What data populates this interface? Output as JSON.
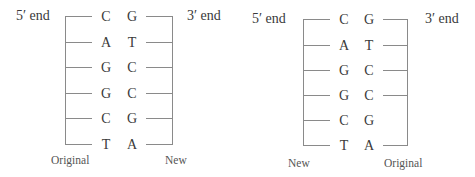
{
  "diagrams": [
    {
      "five_prime_label": "5′ end",
      "three_prime_label": "3′ end",
      "left_strand_label": "Original",
      "right_strand_label": "New",
      "pairs": [
        {
          "left": "C",
          "right": "G",
          "right_tick": true
        },
        {
          "left": "A",
          "right": "T",
          "right_tick": true
        },
        {
          "left": "G",
          "right": "C",
          "right_tick": true
        },
        {
          "left": "G",
          "right": "C",
          "right_tick": true
        },
        {
          "left": "C",
          "right": "G",
          "right_tick": true
        },
        {
          "left": "T",
          "right": "A",
          "right_tick": true
        }
      ]
    },
    {
      "five_prime_label": "5′ end",
      "three_prime_label": "3′ end",
      "left_strand_label": "New",
      "right_strand_label": "Original",
      "pairs": [
        {
          "left": "C",
          "right": "G",
          "right_tick": true
        },
        {
          "left": "A",
          "right": "T",
          "right_tick": true
        },
        {
          "left": "G",
          "right": "C",
          "right_tick": true
        },
        {
          "left": "G",
          "right": "C",
          "right_tick": true
        },
        {
          "left": "C",
          "right": "G",
          "right_tick": false
        },
        {
          "left": "T",
          "right": "A",
          "right_tick": true
        }
      ]
    }
  ]
}
